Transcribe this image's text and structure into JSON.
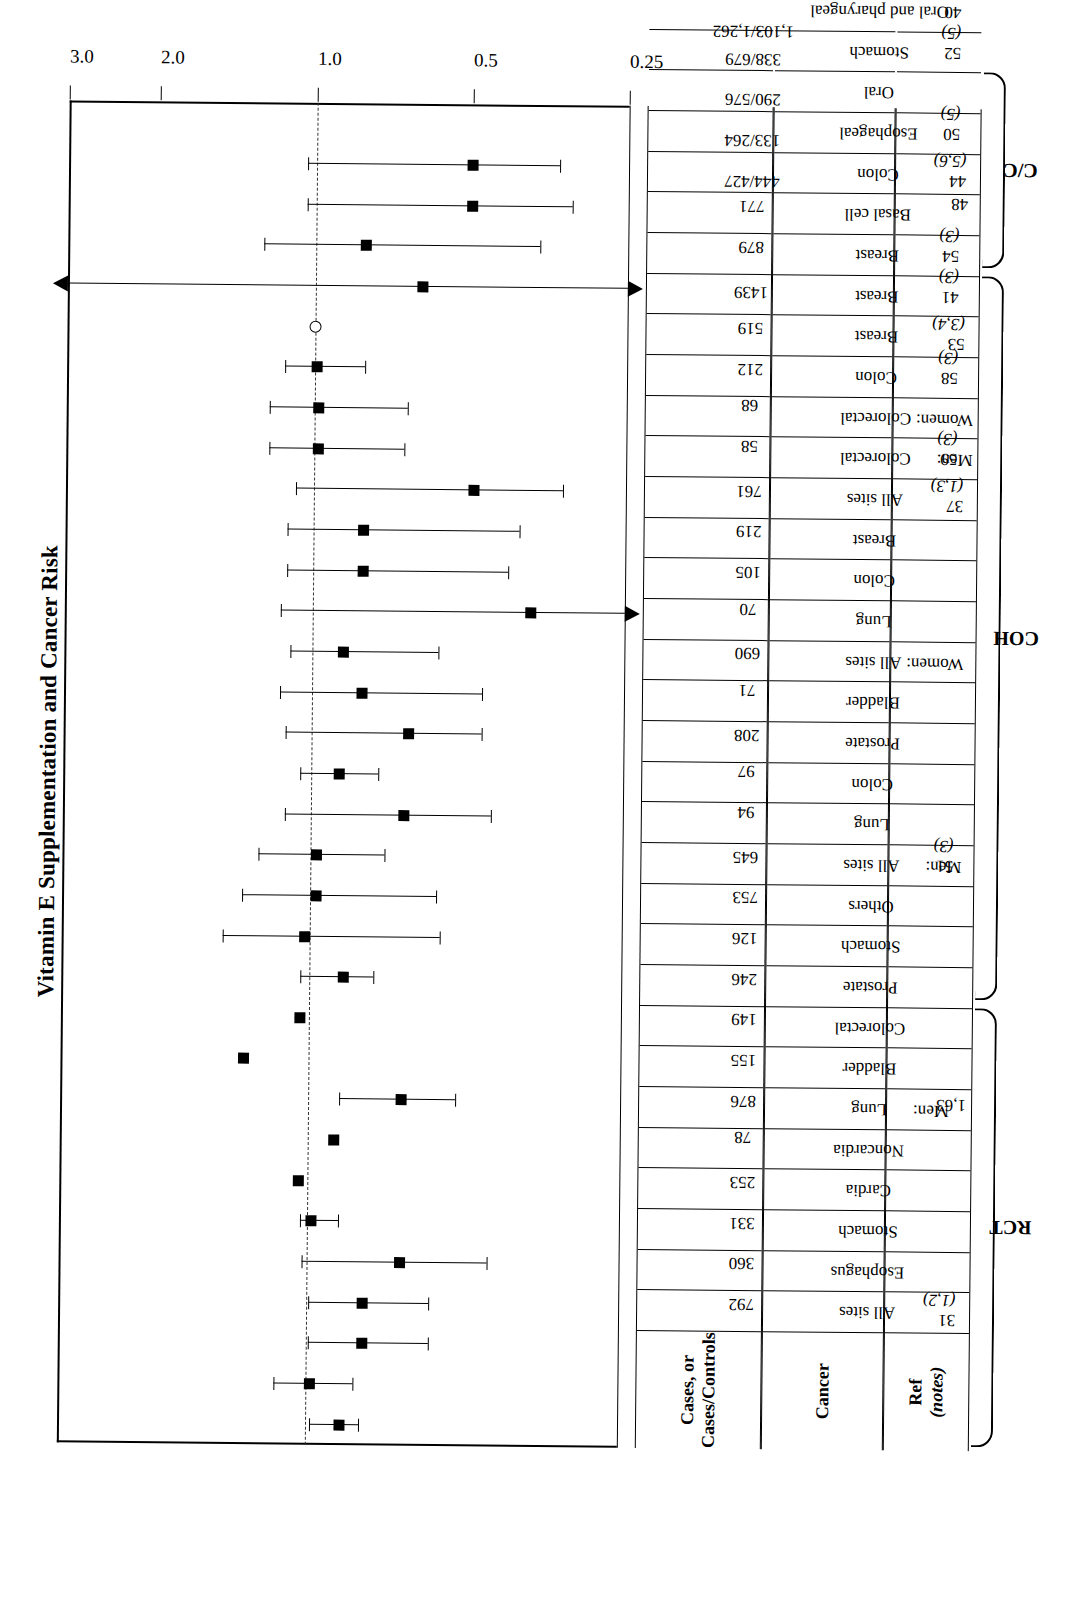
{
  "figure": {
    "title": "Vitamin E Supplementation and Cancer Risk",
    "axis_header_ref": "Ref\n(notes)",
    "header_ref_line1": "Ref",
    "header_ref_line2": "(notes)",
    "header_cancer": "Cancer",
    "header_cases_line1": "Cases, or",
    "header_cases_line2": "Cases/Controls"
  },
  "groups": [
    {
      "label": "RCT",
      "first_row": 0,
      "last_row": 10
    },
    {
      "label": "COH",
      "first_row": 11,
      "last_row": 28
    },
    {
      "label": "C/C",
      "first_row": 29,
      "last_row": 33
    }
  ],
  "chart_data": {
    "type": "scatter",
    "title": "Vitamin E Supplementation and Cancer Risk",
    "xlabel": "",
    "ylabel": "Relative Risk",
    "scale": "log",
    "ylim": [
      0.25,
      3.0
    ],
    "tick_labels": [
      "0.25",
      "0.5",
      "1.0",
      "2.0",
      "3.0"
    ],
    "tick_values": [
      0.25,
      0.5,
      1.0,
      2.0,
      3.0
    ],
    "null_value": 1.0,
    "grid": false,
    "legend": "none",
    "categories": [
      "All sites",
      "Esophagus",
      "Stomach",
      "Cardia",
      "Noncardia",
      "Men: Lung",
      "Bladder",
      "Colorectal",
      "Prostate",
      "Stomach",
      "Others",
      "Men: All sites",
      "Lung",
      "Colon",
      "Prostate",
      "Bladder",
      "Women: All sites",
      "Lung",
      "Colon",
      "Breast",
      "All sites",
      "Men: Colorectal",
      "Women: Colorectal",
      "Colon",
      "Breast",
      "Breast",
      "Breast",
      "Basal cell",
      "Colon",
      "Esophageal",
      "Oral",
      "Stomach",
      "Oral and pharyngeal"
    ],
    "points": [
      {
        "row": 0,
        "ref": "31 (1,2)",
        "cancer": "All sites",
        "cases": "792",
        "rr": 0.86,
        "lo": 0.79,
        "hi": 0.98,
        "lo_arrow": false,
        "hi_arrow": false,
        "marker": "square"
      },
      {
        "row": 1,
        "ref": "",
        "cancer": "Esophagus",
        "cases": "360",
        "rr": 0.98,
        "lo": 0.81,
        "hi": 1.15,
        "lo_arrow": false,
        "hi_arrow": false,
        "marker": "square"
      },
      {
        "row": 2,
        "ref": "",
        "cancer": "Stomach",
        "cases": "331",
        "rr": 0.78,
        "lo": 0.58,
        "hi": 0.99,
        "lo_arrow": false,
        "hi_arrow": false,
        "marker": "square"
      },
      {
        "row": 3,
        "ref": "",
        "cancer": "Cardia",
        "cases": "253",
        "rr": 0.78,
        "lo": 0.58,
        "hi": 0.99,
        "lo_arrow": false,
        "hi_arrow": false,
        "marker": "square"
      },
      {
        "row": 4,
        "ref": "",
        "cancer": "Noncardia",
        "cases": "78",
        "rr": 0.66,
        "lo": 0.45,
        "hi": 1.02,
        "lo_arrow": false,
        "hi_arrow": false,
        "marker": "square"
      },
      {
        "row": 5,
        "ref": "1,63",
        "cancer": "Lung",
        "cases": "876",
        "rr": 0.98,
        "lo": 0.87,
        "hi": 1.03,
        "lo_arrow": false,
        "hi_arrow": false,
        "marker": "square",
        "group_head": "Men:"
      },
      {
        "row": 6,
        "ref": "",
        "cancer": "Bladder",
        "cases": "155",
        "rr": 1.04,
        "lo": null,
        "hi": null,
        "lo_arrow": false,
        "hi_arrow": false,
        "marker": "square"
      },
      {
        "row": 7,
        "ref": "",
        "cancer": "Colorectal",
        "cases": "149",
        "rr": 0.89,
        "lo": null,
        "hi": null,
        "lo_arrow": false,
        "hi_arrow": false,
        "marker": "square"
      },
      {
        "row": 8,
        "ref": "",
        "cancer": "Prostate",
        "cases": "246",
        "rr": 0.66,
        "lo": 0.52,
        "hi": 0.87,
        "lo_arrow": false,
        "hi_arrow": false,
        "marker": "square"
      },
      {
        "row": 9,
        "ref": "",
        "cancer": "Stomach",
        "cases": "126",
        "rr": 1.33,
        "lo": null,
        "hi": null,
        "lo_arrow": false,
        "hi_arrow": false,
        "marker": "square"
      },
      {
        "row": 10,
        "ref": "",
        "cancer": "Others",
        "cases": "753",
        "rr": 1.04,
        "lo": null,
        "hi": null,
        "lo_arrow": false,
        "hi_arrow": false,
        "marker": "square"
      },
      {
        "row": 11,
        "ref": "51 (3)",
        "cancer": "All sites",
        "cases": "645",
        "rr": 0.86,
        "lo": 0.75,
        "hi": 1.04,
        "lo_arrow": false,
        "hi_arrow": false,
        "marker": "square",
        "group_head": "Men:"
      },
      {
        "row": 12,
        "ref": "",
        "cancer": "Lung",
        "cases": "94",
        "rr": 1.02,
        "lo": 0.56,
        "hi": 1.47,
        "lo_arrow": false,
        "hi_arrow": false,
        "marker": "square"
      },
      {
        "row": 13,
        "ref": "",
        "cancer": "Colon",
        "cases": "97",
        "rr": 0.97,
        "lo": 0.57,
        "hi": 1.35,
        "lo_arrow": false,
        "hi_arrow": false,
        "marker": "square"
      },
      {
        "row": 14,
        "ref": "",
        "cancer": "Prostate",
        "cases": "208",
        "rr": 0.97,
        "lo": 0.72,
        "hi": 1.26,
        "lo_arrow": false,
        "hi_arrow": false,
        "marker": "square"
      },
      {
        "row": 15,
        "ref": "",
        "cancer": "Bladder",
        "cases": "71",
        "rr": 0.66,
        "lo": 0.45,
        "hi": 1.12,
        "lo_arrow": false,
        "hi_arrow": false,
        "marker": "square"
      },
      {
        "row": 16,
        "ref": "",
        "cancer": "All sites",
        "cases": "690",
        "rr": 0.88,
        "lo": 0.74,
        "hi": 1.05,
        "lo_arrow": false,
        "hi_arrow": false,
        "marker": "square",
        "group_head": "Women:"
      },
      {
        "row": 17,
        "ref": "",
        "cancer": "Lung",
        "cases": "70",
        "rr": 0.65,
        "lo": 0.47,
        "hi": 1.12,
        "lo_arrow": false,
        "hi_arrow": false,
        "marker": "square"
      },
      {
        "row": 18,
        "ref": "",
        "cancer": "Colon",
        "cases": "105",
        "rr": 0.8,
        "lo": 0.47,
        "hi": 1.15,
        "lo_arrow": false,
        "hi_arrow": false,
        "marker": "square"
      },
      {
        "row": 19,
        "ref": "",
        "cancer": "Breast",
        "cases": "219",
        "rr": 0.87,
        "lo": 0.57,
        "hi": 1.1,
        "lo_arrow": false,
        "hi_arrow": false,
        "marker": "square"
      },
      {
        "row": 20,
        "ref": "37 (1,3)",
        "cancer": "All sites",
        "cases": "761",
        "rr": 0.38,
        "lo": 0.25,
        "hi": 1.15,
        "lo_arrow": true,
        "hi_arrow": false,
        "marker": "square"
      },
      {
        "row": 21,
        "ref": "59 (3)",
        "cancer": "Colorectal",
        "cases": "58",
        "rr": 0.8,
        "lo": 0.42,
        "hi": 1.12,
        "lo_arrow": false,
        "hi_arrow": false,
        "marker": "square",
        "group_head": "Men:"
      },
      {
        "row": 22,
        "ref": "",
        "cancer": "Colorectal",
        "cases": "68",
        "rr": 0.8,
        "lo": 0.4,
        "hi": 1.12,
        "lo_arrow": false,
        "hi_arrow": false,
        "marker": "square",
        "group_head": "Women:"
      },
      {
        "row": 23,
        "ref": "58 (3)",
        "cancer": "Colon",
        "cases": "212",
        "rr": 0.49,
        "lo": 0.33,
        "hi": 1.08,
        "lo_arrow": false,
        "hi_arrow": false,
        "marker": "square"
      },
      {
        "row": 24,
        "ref": "53 (3,4)",
        "cancer": "Breast",
        "cases": "519",
        "rr": 0.98,
        "lo": 0.67,
        "hi": 1.22,
        "lo_arrow": false,
        "hi_arrow": false,
        "marker": "square"
      },
      {
        "row": 25,
        "ref": "41 (3)",
        "cancer": "Breast",
        "cases": "1439",
        "rr": 0.98,
        "lo": 0.66,
        "hi": 1.22,
        "lo_arrow": false,
        "hi_arrow": false,
        "marker": "square"
      },
      {
        "row": 26,
        "ref": "54 (3)",
        "cancer": "Breast",
        "cases": "879",
        "rr": 0.99,
        "lo": 0.8,
        "hi": 1.14,
        "lo_arrow": false,
        "hi_arrow": false,
        "marker": "square"
      },
      {
        "row": 27,
        "ref": "48",
        "cancer": "Basal cell",
        "cases": "771",
        "rr": 1.0,
        "lo": null,
        "hi": null,
        "lo_arrow": false,
        "hi_arrow": false,
        "marker": "circle"
      },
      {
        "row": 28,
        "ref": "44 (5,6)",
        "cancer": "Colon",
        "cases": "444/427",
        "rr": 0.62,
        "lo": 0.25,
        "hi": 3.0,
        "lo_arrow": true,
        "hi_arrow": true,
        "marker": "square"
      },
      {
        "row": 29,
        "ref": "50 (5)",
        "cancer": "Esophageal",
        "cases": "133/264",
        "rr": 0.8,
        "lo": 0.37,
        "hi": 1.26,
        "lo_arrow": false,
        "hi_arrow": false,
        "marker": "square"
      },
      {
        "row": 30,
        "ref": "",
        "cancer": "Oral",
        "cases": "290/576",
        "rr": 0.5,
        "lo": 0.32,
        "hi": 1.04,
        "lo_arrow": false,
        "hi_arrow": false,
        "marker": "square"
      },
      {
        "row": 31,
        "ref": "52 (5)",
        "cancer": "Stomach",
        "cases": "338/679",
        "rr": 0.5,
        "lo": 0.34,
        "hi": 1.04,
        "lo_arrow": false,
        "hi_arrow": false,
        "marker": "square"
      },
      {
        "row": 32,
        "ref": "40 (5)",
        "cancer": "Oral and pharyngeal",
        "cases": "1,103/1,262",
        "rr": null,
        "lo": null,
        "hi": null,
        "lo_arrow": false,
        "hi_arrow": false,
        "marker": "none"
      }
    ]
  },
  "table": {
    "rows": [
      {
        "ref": "31 (1,2)",
        "ref_italic": "(1,2)",
        "ref_num": "31",
        "group_head": "",
        "cancer": "All sites",
        "cases": "792",
        "divider_before": true
      },
      {
        "ref": "",
        "group_head": "",
        "cancer": "Esophagus",
        "cases": "360"
      },
      {
        "ref": "",
        "group_head": "",
        "cancer": "Stomach",
        "cases": "331"
      },
      {
        "ref": "",
        "group_head": "",
        "cancer": "Cardia",
        "cases": "253"
      },
      {
        "ref": "",
        "group_head": "",
        "cancer": "Noncardia",
        "cases": "78"
      },
      {
        "ref": "1,63",
        "group_head": "Men:",
        "cancer": "Lung",
        "cases": "876",
        "divider_before": true
      },
      {
        "ref": "",
        "group_head": "",
        "cancer": "Bladder",
        "cases": "155"
      },
      {
        "ref": "",
        "group_head": "",
        "cancer": "Colorectal",
        "cases": "149"
      },
      {
        "ref": "",
        "group_head": "",
        "cancer": "Prostate",
        "cases": "246"
      },
      {
        "ref": "",
        "group_head": "",
        "cancer": "Stomach",
        "cases": "126"
      },
      {
        "ref": "",
        "group_head": "",
        "cancer": "Others",
        "cases": "753"
      },
      {
        "ref": "51 (3)",
        "group_head": "Men:",
        "cancer": "All sites",
        "cases": "645",
        "divider_before": true
      },
      {
        "ref": "",
        "group_head": "",
        "cancer": "Lung",
        "cases": "94"
      },
      {
        "ref": "",
        "group_head": "",
        "cancer": "Colon",
        "cases": "97"
      },
      {
        "ref": "",
        "group_head": "",
        "cancer": "Prostate",
        "cases": "208"
      },
      {
        "ref": "",
        "group_head": "",
        "cancer": "Bladder",
        "cases": "71"
      },
      {
        "ref": "",
        "group_head": "Women:",
        "cancer": "All sites",
        "cases": "690"
      },
      {
        "ref": "",
        "group_head": "",
        "cancer": "Lung",
        "cases": "70"
      },
      {
        "ref": "",
        "group_head": "",
        "cancer": "Colon",
        "cases": "105"
      },
      {
        "ref": "",
        "group_head": "",
        "cancer": "Breast",
        "cases": "219"
      },
      {
        "ref": "37 (1,3)",
        "group_head": "",
        "cancer": "All sites",
        "cases": "761",
        "divider_before": true
      },
      {
        "ref": "59 (3)",
        "group_head": "Men:",
        "cancer": "Colorectal",
        "cases": "58",
        "divider_before": true
      },
      {
        "ref": "",
        "group_head": "Women:",
        "cancer": "Colorectal",
        "cases": "68"
      },
      {
        "ref": "58 (3)",
        "group_head": "",
        "cancer": "Colon",
        "cases": "212",
        "divider_before": true
      },
      {
        "ref": "53 (3,4)",
        "group_head": "",
        "cancer": "Breast",
        "cases": "519",
        "divider_before": true
      },
      {
        "ref": "41 (3)",
        "group_head": "",
        "cancer": "Breast",
        "cases": "1439",
        "divider_before": true
      },
      {
        "ref": "54 (3)",
        "group_head": "",
        "cancer": "Breast",
        "cases": "879",
        "divider_before": true
      },
      {
        "ref": "48",
        "group_head": "",
        "cancer": "Basal cell",
        "cases": "771",
        "divider_before": true
      },
      {
        "ref": "44 (5,6)",
        "group_head": "",
        "cancer": "Colon",
        "cases": "444/427",
        "divider_before": true
      },
      {
        "ref": "50 (5)",
        "group_head": "",
        "cancer": "Esophageal",
        "cases": "133/264",
        "divider_before": true
      },
      {
        "ref": "",
        "group_head": "",
        "cancer": "Oral",
        "cases": "290/576"
      },
      {
        "ref": "52 (5)",
        "group_head": "",
        "cancer": "Stomach",
        "cases": "338/679",
        "divider_before": true
      },
      {
        "ref": "40 (5)",
        "group_head": "",
        "cancer": "Oral and pharyngeal",
        "cases": "1,103/1,262",
        "divider_before": true
      }
    ]
  }
}
